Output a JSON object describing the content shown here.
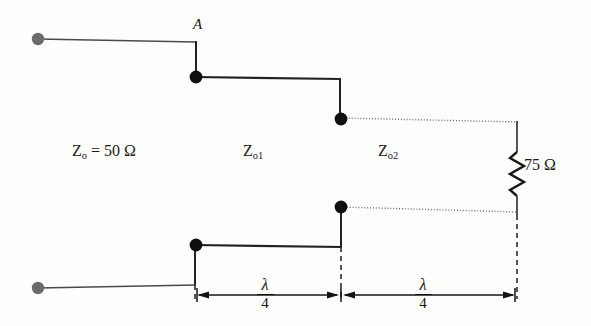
{
  "figure": {
    "kind": "circuit-schematic"
  },
  "labels": {
    "node_a": "A",
    "source_impedance": "Z",
    "source_impedance_sub": "o",
    "source_impedance_value": " = 50 Ω",
    "section1_impedance": "Z",
    "section1_impedance_sub": "o1",
    "section2_impedance": "Z",
    "section2_impedance_sub": "o2",
    "load_resistance": "75 Ω"
  },
  "dimensions": [
    {
      "name": "first-quarter-wave",
      "numerator": "λ",
      "denominator": "4"
    },
    {
      "name": "second-quarter-wave",
      "numerator": "λ",
      "denominator": "4"
    }
  ],
  "colors": {
    "conductor": "#2b2b2b",
    "conductor_light": "#5a5a5a",
    "terminal_gray": "#6b6b6b",
    "node_black": "#101010",
    "dashed_reference": "#1f1f1f",
    "dotted_trace": "#6e6e6e",
    "background": "#fdfdfc",
    "text": "#1b1b1b"
  },
  "elements": {
    "input_terminal_top": "input-terminal-top",
    "input_terminal_bottom": "input-terminal-bottom",
    "junction_a_top": "junction-node-a-top",
    "junction_a_bottom": "junction-node-a-bottom",
    "junction_b_top": "junction-node-b-top",
    "junction_b_bottom": "junction-node-b-bottom",
    "load_resistor": "load-resistor-zigzag"
  }
}
